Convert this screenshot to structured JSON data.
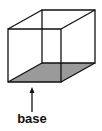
{
  "diagram": {
    "label": "base",
    "colors": {
      "stroke": "#111111",
      "base_fill": "#9a9a9a",
      "background": "#ffffff"
    },
    "vertices": {
      "front_top_left": [
        8,
        29
      ],
      "front_top_right": [
        61,
        29
      ],
      "front_bottom_left": [
        8,
        82
      ],
      "front_bottom_right": [
        61,
        82
      ],
      "back_top_left": [
        42,
        10
      ],
      "back_top_right": [
        95,
        10
      ],
      "back_bottom_left": [
        42,
        63
      ],
      "back_bottom_right": [
        95,
        63
      ]
    },
    "arrow": {
      "x": 32,
      "from_y": 112,
      "to_y": 88
    }
  }
}
